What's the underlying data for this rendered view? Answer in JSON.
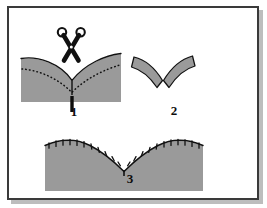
{
  "figure": {
    "width": 267,
    "height": 208,
    "background_color": "#ffffff",
    "frame": {
      "border_color": "#3a3a3a",
      "shadow_color": "#bdbdbd",
      "border_width": 2
    },
    "colors": {
      "fabric_gray": "#9a9a9a",
      "fabric_gray_edge": "#8e8e8e",
      "outline_black": "#111111",
      "stitch_dots": "#111111",
      "label_text": "#0d0d0d"
    },
    "steps": [
      {
        "number": "1",
        "label": "1",
        "caption": "Cut the V-notch open to the stitching line with scissors",
        "icon": "scissors-icon",
        "elements": [
          "fabric-panel-gray",
          "v-notch-opening",
          "dotted-stitching-line",
          "vertical-clip-cut",
          "scissors"
        ]
      },
      {
        "number": "2",
        "label": "2",
        "caption": "The two curved seam allowance bands separated at the V",
        "elements": [
          "left-curved-band",
          "right-curved-band"
        ]
      },
      {
        "number": "3",
        "label": "3",
        "caption": "Finished curved edge with notches clipped along the seam",
        "elements": [
          "fabric-panel-gray",
          "curved-top-edge",
          "notch-tick-marks",
          "center-v-point"
        ]
      }
    ]
  }
}
